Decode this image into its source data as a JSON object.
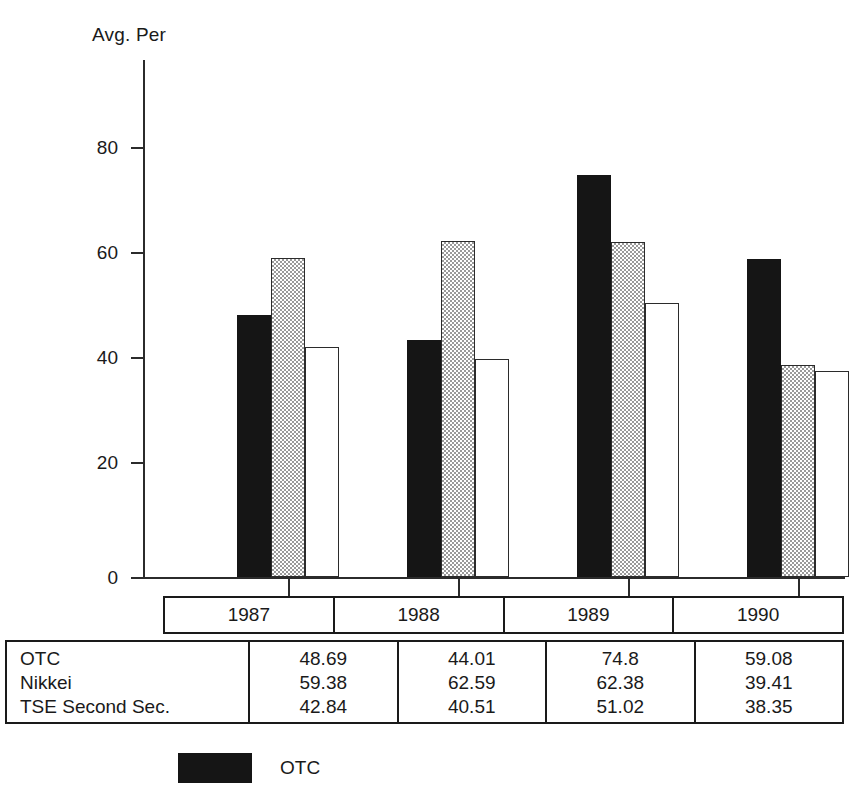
{
  "chart_data": {
    "type": "bar",
    "title": "",
    "ylabel": "Avg. Per",
    "xlabel": "",
    "categories": [
      "1987",
      "1988",
      "1989",
      "1990"
    ],
    "series": [
      {
        "name": "OTC",
        "values": [
          48.69,
          44.01,
          74.8,
          59.08
        ],
        "style": "solid-black"
      },
      {
        "name": "Nikkei",
        "values": [
          59.38,
          62.59,
          62.38,
          39.41
        ],
        "style": "gray-dither"
      },
      {
        "name": "TSE Second Sec.",
        "values": [
          42.84,
          40.51,
          51.02,
          38.35
        ],
        "style": "white-outline"
      }
    ],
    "ylim": [
      0,
      88
    ],
    "yticks": [
      0,
      20,
      40,
      60,
      80
    ],
    "ytick_labels": [
      "0",
      "20",
      "40",
      "60",
      "80"
    ],
    "grid": false,
    "legend_position": "bottom-left",
    "legend_entries": [
      "OTC"
    ]
  },
  "axis": {
    "y_title": "Avg. Per",
    "ticks": [
      {
        "label": "80",
        "value": 80
      },
      {
        "label": "60",
        "value": 60
      },
      {
        "label": "40",
        "value": 40
      },
      {
        "label": "20",
        "value": 20
      },
      {
        "label": "0",
        "value": 0
      }
    ]
  },
  "year_header": {
    "years": [
      "1987",
      "1988",
      "1989",
      "1990"
    ]
  },
  "table": {
    "row_labels": [
      "OTC",
      "Nikkei",
      "TSE Second Sec."
    ],
    "columns": [
      {
        "year": "1987",
        "values": [
          "48.69",
          "59.38",
          "42.84"
        ]
      },
      {
        "year": "1988",
        "values": [
          "44.01",
          "62.59",
          "40.51"
        ]
      },
      {
        "year": "1989",
        "values": [
          "74.8",
          "62.38",
          "51.02"
        ]
      },
      {
        "year": "1990",
        "values": [
          "59.08",
          "39.41",
          "38.35"
        ]
      }
    ]
  },
  "legend": {
    "items": [
      {
        "label": "OTC",
        "swatch": "solid-black"
      }
    ]
  },
  "colors": {
    "bar_otc": "#151515",
    "bar_nikkei_pattern": "#9a9a9a",
    "bar_tse": "#ffffff",
    "axis": "#2b2b2b",
    "text": "#1a1a1a",
    "background": "#ffffff"
  }
}
